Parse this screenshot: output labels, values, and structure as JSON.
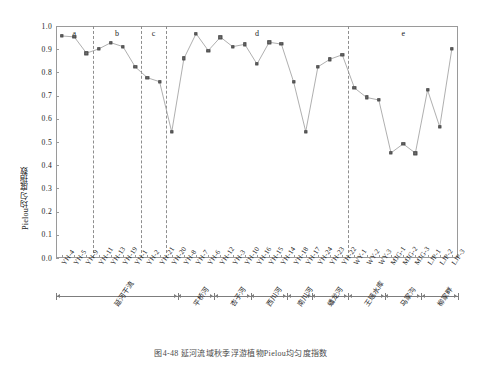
{
  "chart_data": {
    "type": "line",
    "title": "图4-48 延河流域秋季浮游植物Pielou均匀度指数",
    "xlabel": "",
    "ylabel": "Pielou均匀度指数",
    "ylim": [
      0.0,
      1.0
    ],
    "ytick_labels": [
      "0.0",
      "0.1",
      "0.2",
      "0.3",
      "0.4",
      "0.5",
      "0.6",
      "0.7",
      "0.8",
      "0.9",
      "1.0"
    ],
    "ytick_values": [
      0.0,
      0.1,
      0.2,
      0.3,
      0.4,
      0.5,
      0.6,
      0.7,
      0.8,
      0.9,
      1.0
    ],
    "grid": false,
    "legend": "none",
    "categories": [
      "YH-4",
      "YH-5",
      "YH-9",
      "YH-11",
      "YH-13",
      "YH-19",
      "YH-1",
      "YH-2",
      "YH-21",
      "YH-20",
      "YH-8",
      "YH-7",
      "YH-6",
      "YH-12",
      "YH-3",
      "YH-10",
      "YH-16",
      "YH-15",
      "YH-14",
      "YH-18",
      "YH-17",
      "YH-24",
      "YH-23",
      "YH-22",
      "WY-1",
      "WY-2",
      "WY-3",
      "MJG-1",
      "MJG-2",
      "MJG-3",
      "LJP-1",
      "LJP-2",
      "LJP-3"
    ],
    "values": [
      0.957,
      0.953,
      0.883,
      0.901,
      0.928,
      0.911,
      0.824,
      0.777,
      0.76,
      0.543,
      0.86,
      0.967,
      0.894,
      0.952,
      0.911,
      0.921,
      0.836,
      0.93,
      0.922,
      0.76,
      0.545,
      0.824,
      0.857,
      0.876,
      0.733,
      0.692,
      0.681,
      0.453,
      0.492,
      0.452,
      0.724,
      0.565,
      0.903
    ],
    "significance_groups": [
      {
        "label": "a",
        "start_index": 0,
        "end_index": 2
      },
      {
        "label": "b",
        "start_index": 3,
        "end_index": 6
      },
      {
        "label": "c",
        "start_index": 7,
        "end_index": 8
      },
      {
        "label": "d",
        "start_index": 9,
        "end_index": 23
      },
      {
        "label": "e",
        "start_index": 24,
        "end_index": 32
      }
    ],
    "river_groups": [
      {
        "name": "延河干流",
        "start_index": 0,
        "end_index": 9
      },
      {
        "name": "平桥河",
        "start_index": 10,
        "end_index": 12
      },
      {
        "name": "杏子河",
        "start_index": 13,
        "end_index": 15
      },
      {
        "name": "西川河",
        "start_index": 16,
        "end_index": 18
      },
      {
        "name": "南川河",
        "start_index": 19,
        "end_index": 20
      },
      {
        "name": "蟠龙河",
        "start_index": 21,
        "end_index": 23
      },
      {
        "name": "王瑶水库",
        "start_index": 24,
        "end_index": 26
      },
      {
        "name": "马家沟",
        "start_index": 27,
        "end_index": 29
      },
      {
        "name": "柳家畔",
        "start_index": 30,
        "end_index": 32
      }
    ],
    "marker_color": "#6f6f6f",
    "line_color": "#9a9a9a"
  },
  "caption": {
    "text": "图4-48  延河流域秋季浮游植物Pielou均匀度指数"
  }
}
